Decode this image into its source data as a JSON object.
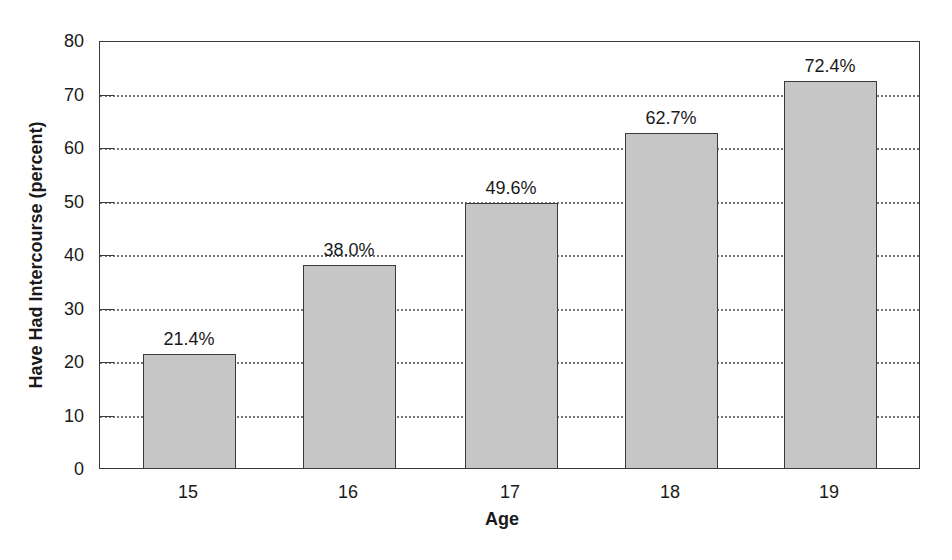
{
  "chart_data": {
    "type": "bar",
    "title": "",
    "xlabel": "Age",
    "ylabel": "Have Had Intercourse (percent)",
    "categories": [
      "15",
      "16",
      "17",
      "18",
      "19"
    ],
    "values": [
      21.4,
      38.0,
      49.6,
      62.7,
      72.4
    ],
    "value_labels": [
      "21.4%",
      "38.0%",
      "49.6%",
      "62.7%",
      "72.4%"
    ],
    "ylim": [
      0,
      80
    ],
    "yticks": [
      "0",
      "10",
      "20",
      "30",
      "40",
      "50",
      "60",
      "70",
      "80"
    ],
    "grid": "horizontal dotted",
    "legend": "none",
    "bar_color": "#c6c6c6"
  }
}
